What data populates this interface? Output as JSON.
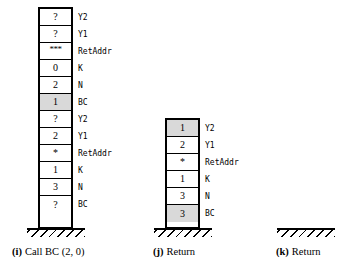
{
  "figure": {
    "title_present": false,
    "panels": [
      {
        "id": "i",
        "caption_label": "(i)",
        "caption_text": "Call BC (2, 0)",
        "frames": [
          {
            "name": "activation-record-top",
            "rows": [
              {
                "value": "?",
                "label": "Y2",
                "shaded": false
              },
              {
                "value": "?",
                "label": "Y1",
                "shaded": false
              },
              {
                "value": "***",
                "label": "RetAddr",
                "shaded": false
              },
              {
                "value": "0",
                "label": "K",
                "shaded": false
              },
              {
                "value": "2",
                "label": "N",
                "shaded": false
              },
              {
                "value": "1",
                "label": "BC",
                "shaded": true
              }
            ]
          },
          {
            "name": "activation-record-bottom",
            "rows": [
              {
                "value": "?",
                "label": "Y2",
                "shaded": false
              },
              {
                "value": "2",
                "label": "Y1",
                "shaded": false
              },
              {
                "value": "*",
                "label": "RetAddr",
                "shaded": false
              },
              {
                "value": "1",
                "label": "K",
                "shaded": false
              },
              {
                "value": "3",
                "label": "N",
                "shaded": false
              },
              {
                "value": "?",
                "label": "BC",
                "shaded": false
              }
            ]
          }
        ]
      },
      {
        "id": "j",
        "caption_label": "(j)",
        "caption_text": "Return",
        "frames": [
          {
            "name": "activation-record",
            "rows": [
              {
                "value": "1",
                "label": "Y2",
                "shaded": true
              },
              {
                "value": "2",
                "label": "Y1",
                "shaded": false
              },
              {
                "value": "*",
                "label": "RetAddr",
                "shaded": false
              },
              {
                "value": "1",
                "label": "K",
                "shaded": false
              },
              {
                "value": "3",
                "label": "N",
                "shaded": false
              },
              {
                "value": "3",
                "label": "BC",
                "shaded": true
              }
            ]
          }
        ]
      },
      {
        "id": "k",
        "caption_label": "(k)",
        "caption_text": "Return",
        "frames": []
      }
    ]
  },
  "colors": {
    "stroke": "#000000",
    "shaded_cell": "#d9d9d9",
    "background": "#ffffff"
  }
}
